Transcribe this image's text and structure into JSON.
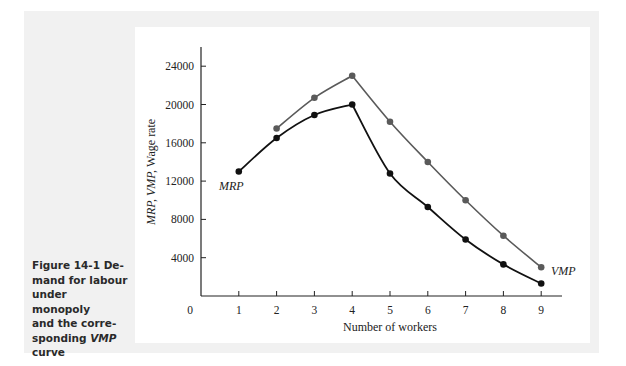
{
  "figure": {
    "caption_prefix": "Figure 14-1",
    "caption_lines": [
      "Figure 14-1 De-",
      "mand for labour",
      "under monopoly",
      "and the corre-",
      "sponding VMP",
      "curve"
    ],
    "caption_text": "Figure 14-1 Demand for labour under monopoly and the corresponding VMP curve"
  },
  "chart_data": {
    "type": "line",
    "xlabel": "Number of workers",
    "ylabel": "MRP, VMP, Wage rate",
    "x_ticks": [
      0,
      1,
      2,
      3,
      4,
      5,
      6,
      7,
      8,
      9
    ],
    "y_ticks": [
      4000,
      8000,
      12000,
      16000,
      20000,
      24000
    ],
    "xlim": [
      0,
      9.5
    ],
    "ylim": [
      0,
      25500
    ],
    "grid": false,
    "legend": "inline labels",
    "series": [
      {
        "name": "MRP",
        "color": "#111111",
        "x": [
          1,
          2,
          3,
          4,
          5,
          6,
          7,
          8,
          9
        ],
        "values": [
          13000,
          16500,
          18900,
          20000,
          12800,
          9300,
          5900,
          3300,
          1300
        ]
      },
      {
        "name": "VMP",
        "color": "#5a5a5a",
        "x": [
          2,
          3,
          4,
          5,
          6,
          7,
          8,
          9
        ],
        "values": [
          17500,
          20700,
          23000,
          18200,
          14000,
          10000,
          6300,
          3000
        ]
      }
    ]
  }
}
